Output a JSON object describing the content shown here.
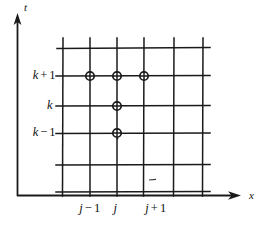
{
  "figure": {
    "type": "finite-difference-grid-stencil",
    "background_color": "#ffffff",
    "line_color": "#1a1a1a",
    "axes": {
      "x_axis_label": "x",
      "y_axis_label": "t",
      "origin": {
        "x": 17,
        "y": 196
      },
      "x_axis_end": {
        "x": 240,
        "y": 196
      },
      "y_axis_end": {
        "x": 17,
        "y": 16
      }
    },
    "grid": {
      "vertical_lines_x": [
        63,
        90,
        117,
        144,
        174,
        203
      ],
      "horizontal_lines_y": [
        48,
        76,
        106,
        133,
        165,
        192
      ],
      "vertical_top_y": 38,
      "vertical_bottom_y": 196,
      "horizontal_left_x": 56,
      "horizontal_right_x": 210
    },
    "y_ticks": [
      {
        "id": "k-plus-1",
        "value": "k + 1",
        "var": "k",
        "op": "+",
        "num": "1",
        "y": 76,
        "label_right_x": 68
      },
      {
        "id": "k",
        "value": "k",
        "var": "k",
        "op": "",
        "num": "",
        "y": 106,
        "label_right_x": 68
      },
      {
        "id": "k-minus-1",
        "value": "k − 1",
        "var": "k",
        "op": "−",
        "num": "1",
        "y": 133,
        "label_right_x": 68
      }
    ],
    "x_ticks": [
      {
        "id": "j-minus-1",
        "value": "j − 1",
        "var": "j",
        "op": "−",
        "num": "1",
        "x": 90
      },
      {
        "id": "j",
        "value": "j",
        "var": "j",
        "op": "",
        "num": "",
        "x": 117
      },
      {
        "id": "j-plus-1",
        "value": "j + 1",
        "var": "j",
        "op": "+",
        "num": "1",
        "x": 144
      }
    ],
    "stencil_nodes": [
      {
        "id": "node-j-minus-1-k-plus-1",
        "x": 90,
        "y": 76,
        "grid_x": "j - 1",
        "grid_t": "k + 1"
      },
      {
        "id": "node-j-k-plus-1",
        "x": 117,
        "y": 76,
        "grid_x": "j",
        "grid_t": "k + 1"
      },
      {
        "id": "node-j-plus-1-k-plus-1",
        "x": 144,
        "y": 76,
        "grid_x": "j + 1",
        "grid_t": "k + 1"
      },
      {
        "id": "node-j-k",
        "x": 117,
        "y": 106,
        "grid_x": "j",
        "grid_t": "k"
      },
      {
        "id": "node-j-k-minus-1",
        "x": 117,
        "y": 133,
        "grid_x": "j",
        "grid_t": "k - 1"
      }
    ],
    "node_marker": {
      "radius": 4.2,
      "fill": "#ffffff",
      "stroke": "#1a1a1a",
      "stroke_width": 1.6
    },
    "stray_mark": {
      "x": 152,
      "y": 180,
      "width": 7
    }
  }
}
